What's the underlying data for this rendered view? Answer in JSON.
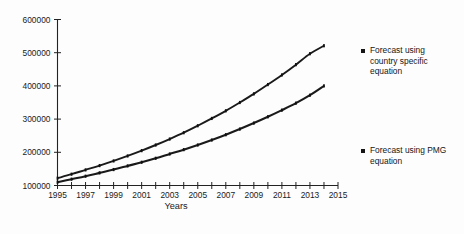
{
  "chart_data": {
    "type": "line",
    "title": "",
    "subtitle": "",
    "xlabel": "Years",
    "ylabel": "",
    "xlim": [
      1995,
      2015
    ],
    "ylim": [
      100000,
      600000
    ],
    "grid": false,
    "legend_position": "right",
    "x_tick_labels": [
      "1995",
      "1997",
      "1999",
      "2001",
      "2003",
      "2005",
      "2007",
      "2009",
      "2011",
      "2013",
      "2015"
    ],
    "x_tick_values": [
      1995,
      1997,
      1999,
      2001,
      2003,
      2005,
      2007,
      2009,
      2011,
      2013,
      2015
    ],
    "x_minor_ticks": [
      1996,
      1998,
      2000,
      2002,
      2004,
      2006,
      2008,
      2010,
      2012,
      2014
    ],
    "y_tick_labels": [
      "600000",
      "500000",
      "400000",
      "300000",
      "200000",
      "100000"
    ],
    "y_tick_values": [
      600000,
      500000,
      400000,
      300000,
      200000,
      100000
    ],
    "x": [
      1995,
      1996,
      1997,
      1998,
      1999,
      2000,
      2001,
      2002,
      2003,
      2004,
      2005,
      2006,
      2007,
      2008,
      2009,
      2010,
      2011,
      2012,
      2013,
      2014
    ],
    "series": [
      {
        "name": "Forecast using country specific equation",
        "marker": "square",
        "color": "#1a1a1a",
        "values": [
          122000,
          134000,
          147000,
          160000,
          174000,
          189000,
          205000,
          222000,
          240000,
          259000,
          280000,
          302000,
          325000,
          350000,
          376000,
          404000,
          433000,
          464000,
          497000,
          521000
        ]
      },
      {
        "name": "Forecast using PMG equation",
        "marker": "square",
        "color": "#1a1a1a",
        "values": [
          110000,
          119000,
          128000,
          138000,
          148000,
          159000,
          170000,
          182000,
          195000,
          208000,
          222000,
          237000,
          253000,
          270000,
          288000,
          307000,
          327000,
          348000,
          372000,
          400000
        ]
      }
    ]
  },
  "legend": {
    "entries": [
      {
        "label": "Forecast using country specific equation",
        "marker": "square-marker"
      },
      {
        "label": "Forecast using PMG equation",
        "marker": "square-marker"
      }
    ]
  },
  "colors": {
    "axis": "#222222",
    "series": "#1a1a1a",
    "background": "#fdfdfd",
    "text": "#1b1b1b"
  }
}
